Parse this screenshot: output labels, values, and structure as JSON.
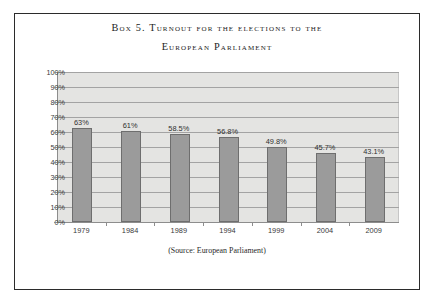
{
  "box": {
    "title_line1": "Box 5.  Turnout for the elections to the",
    "title_line2": "European Parliament",
    "source": "(Source: European Parliament)"
  },
  "chart_data": {
    "type": "bar",
    "title": "Box 5.  Turnout for the elections to the European Parliament",
    "xlabel": "",
    "ylabel": "",
    "categories": [
      "1979",
      "1984",
      "1989",
      "1994",
      "1999",
      "2004",
      "2009"
    ],
    "values": [
      63,
      61,
      58.5,
      56.8,
      49.8,
      45.7,
      43.1
    ],
    "data_labels": [
      "63%",
      "61%",
      "58.5%",
      "56.8%",
      "49.8%",
      "45.7%",
      "43.1%"
    ],
    "ylim": [
      0,
      100
    ],
    "ytick_values": [
      100,
      90,
      80,
      70,
      60,
      50,
      40,
      30,
      20,
      10,
      0
    ],
    "ytick_labels": [
      "100%",
      "90%",
      "80%",
      "70%",
      "60%",
      "50%",
      "40%",
      "30%",
      "20%",
      "10%",
      "0%"
    ],
    "grid": true,
    "legend": false,
    "annotation": "(Source: European Parliament)",
    "colors": {
      "bar_fill": "#9b9b9b",
      "bar_border": "#6e6e6e",
      "plot_background": "#e4e4e2",
      "gridline": "#a3a3a3",
      "frame_border": "#2b2b2b",
      "text": "#2f2f2f"
    }
  }
}
